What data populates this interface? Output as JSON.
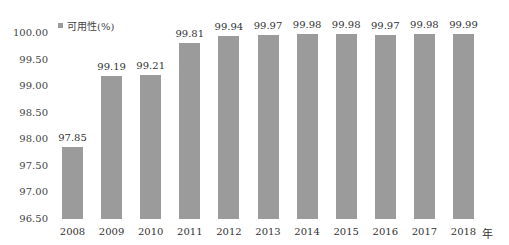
{
  "chart_data": {
    "type": "bar",
    "title": "",
    "xlabel": "",
    "x_unit": "年",
    "ylabel": "",
    "legend": [
      {
        "name": "可用性(%)",
        "color": "#9b9b9b"
      }
    ],
    "legend_position": "top-left",
    "grid": false,
    "ylim": [
      96.5,
      100.0
    ],
    "yticks": [
      "96.50",
      "97.00",
      "97.50",
      "98.00",
      "98.50",
      "99.00",
      "99.50",
      "100.00"
    ],
    "categories": [
      "2008",
      "2009",
      "2010",
      "2011",
      "2012",
      "2013",
      "2014",
      "2015",
      "2016",
      "2017",
      "2018"
    ],
    "series": [
      {
        "name": "可用性(%)",
        "values": [
          97.85,
          99.19,
          99.21,
          99.81,
          99.94,
          99.97,
          99.98,
          99.98,
          99.97,
          99.98,
          99.99
        ],
        "labels": [
          "97.85",
          "99.19",
          "99.21",
          "99.81",
          "99.94",
          "99.97",
          "99.98",
          "99.98",
          "99.97",
          "99.98",
          "99.99"
        ]
      }
    ]
  }
}
